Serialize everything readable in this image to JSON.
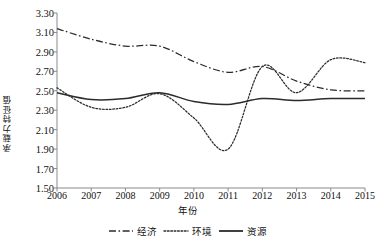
{
  "chart_data": {
    "type": "line",
    "title": "",
    "xlabel": "年份",
    "ylabel": "承载力特征值",
    "x": [
      2006,
      2007,
      2008,
      2009,
      2010,
      2011,
      2012,
      2013,
      2014,
      2015
    ],
    "xtick_labels": [
      "2006",
      "2007",
      "2008",
      "2009",
      "2010",
      "2011",
      "2012",
      "2013",
      "2014",
      "2015"
    ],
    "ytick_labels": [
      "3.30",
      "3.10",
      "2.90",
      "2.70",
      "2.50",
      "2.30",
      "2.10",
      "1.90",
      "1.70",
      "1.50"
    ],
    "ylim": [
      1.5,
      3.3
    ],
    "ytick_step": 0.2,
    "grid": false,
    "legend_position": "bottom-center",
    "series": [
      {
        "name": "经济",
        "style": "dash-dot",
        "color": "#2b2b2b",
        "values": [
          3.14,
          3.03,
          2.96,
          2.96,
          2.8,
          2.69,
          2.75,
          2.6,
          2.51,
          2.5
        ]
      },
      {
        "name": "环境",
        "style": "dotted",
        "color": "#2b2b2b",
        "values": [
          2.53,
          2.33,
          2.33,
          2.47,
          2.22,
          1.9,
          2.75,
          2.48,
          2.82,
          2.79
        ]
      },
      {
        "name": "资源",
        "style": "solid",
        "color": "#2b2b2b",
        "values": [
          2.48,
          2.41,
          2.42,
          2.48,
          2.39,
          2.36,
          2.42,
          2.4,
          2.42,
          2.42
        ]
      }
    ]
  },
  "legend": {
    "items": [
      {
        "label": "经济",
        "style": "dash-dot"
      },
      {
        "label": "环境",
        "style": "dotted"
      },
      {
        "label": "资源",
        "style": "solid"
      }
    ]
  },
  "axes": {
    "axis_color": "#8a8a8a"
  }
}
